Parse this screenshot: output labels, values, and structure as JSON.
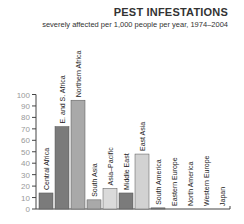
{
  "chart_data": {
    "type": "bar",
    "title": "PEST INFESTATIONS",
    "subtitle": "severely affected per 1,000 people per year, 1974–2004",
    "xlabel": "",
    "ylabel": "",
    "ylim": [
      0,
      100
    ],
    "yticks": [
      0,
      10,
      20,
      30,
      40,
      50,
      60,
      70,
      80,
      90,
      100
    ],
    "grid": false,
    "categories": [
      "Central Africa",
      "E. and S. Africa",
      "Northern Africa",
      "South Asia",
      "Asia–Pacific",
      "Middle East",
      "East Asia",
      "South America",
      "Eastern Europe",
      "North America",
      "Western Europe",
      "Japan"
    ],
    "values": [
      14,
      72,
      95,
      8,
      18,
      14,
      48,
      1,
      0,
      0,
      0,
      0
    ],
    "colors": [
      "#7b7b7b",
      "#7b7b7b",
      "#a9a9a9",
      "#a9a9a9",
      "#dadada",
      "#7b7b7b",
      "#d2d2d2",
      "#7b7b7b",
      "#7b7b7b",
      "#7b7b7b",
      "#7b7b7b",
      "#7b7b7b"
    ]
  }
}
